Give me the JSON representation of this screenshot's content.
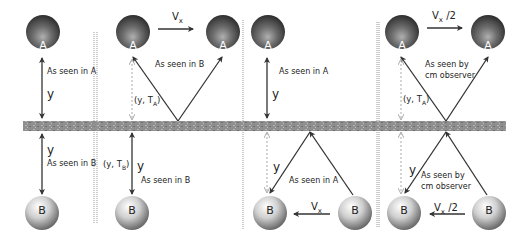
{
  "mirror": {
    "color": "#8a8a8a",
    "texture": "#a8a8a8"
  },
  "colors": {
    "sphere_a_dark": "#3a3a3a",
    "sphere_a_mid": "#7a7a7a",
    "sphere_b_light": "#f2f2f2",
    "sphere_b_dark": "#8c8c8c",
    "arrow": "#333333",
    "dashed_arrow": "#aaaaaa",
    "divider": "#888888"
  },
  "panels": [
    {
      "id": "panel-1",
      "sphere_a_label": "A",
      "sphere_b_label": "B",
      "label_top": "As seen in A",
      "label_bottom": "As seen in B",
      "y_top": "y",
      "y_bottom": "y"
    },
    {
      "id": "panel-2",
      "sphere_a_label": "A",
      "sphere_a2_label": "A",
      "sphere_b_label": "B",
      "velocity_label": "V",
      "velocity_sub": "x",
      "label_top": "As seen in B",
      "label_bottom": "As seen in B",
      "coord_top": "(y, T",
      "coord_top_sub": "A",
      "coord_top_end": ")",
      "coord_bottom": "(y, T",
      "coord_bottom_sub": "B",
      "coord_bottom_end": ")",
      "y_bottom": "y"
    },
    {
      "id": "panel-3",
      "sphere_a_label": "A",
      "sphere_b_label": "B",
      "sphere_b2_label": "B",
      "velocity_label": "V",
      "velocity_sub": "x",
      "label_top": "As seen in A",
      "label_bottom": "As seen in A",
      "y_top": "y",
      "y_bottom": "y"
    },
    {
      "id": "panel-4",
      "sphere_a_label": "A",
      "sphere_a2_label": "A",
      "sphere_b_label": "B",
      "sphere_b2_label": "B",
      "velocity_top": "V",
      "velocity_top_sub": "x",
      "velocity_top_suffix": " /2",
      "velocity_bottom": "V",
      "velocity_bottom_sub": "x",
      "velocity_bottom_suffix": " /2",
      "label_top": "As seen by\ncm observer",
      "label_bottom": "As seen by\ncm observer",
      "coord_top": "(y, T",
      "coord_top_sub": "A",
      "coord_top_end": ")",
      "y_bottom": "y"
    }
  ]
}
